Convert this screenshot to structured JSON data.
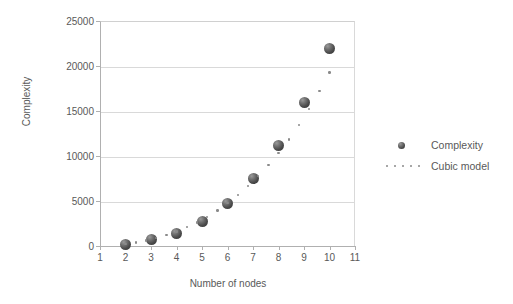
{
  "chart_data": {
    "type": "scatter",
    "title": "",
    "xlabel": "Number of nodes",
    "ylabel": "Complexity",
    "xlim": [
      1,
      11
    ],
    "ylim": [
      0,
      25000
    ],
    "xticks": [
      1,
      2,
      3,
      4,
      5,
      6,
      7,
      8,
      9,
      10,
      11
    ],
    "xtick_labels": [
      "1",
      "2",
      "3",
      "4",
      "5",
      "6",
      "7",
      "8",
      "9",
      "10",
      "11"
    ],
    "yticks": [
      0,
      5000,
      10000,
      15000,
      20000,
      25000
    ],
    "ytick_labels": [
      "0",
      "5000",
      "10000",
      "15000",
      "20000",
      "25000"
    ],
    "grid": "horizontal",
    "legend_position": "right",
    "series": [
      {
        "name": "Complexity",
        "type": "scatter",
        "marker": "sphere",
        "color": "#4a4a4a",
        "x": [
          2,
          3,
          4,
          5,
          6,
          7,
          8,
          9,
          10
        ],
        "values": [
          200,
          700,
          1400,
          2700,
          4700,
          7500,
          11200,
          16000,
          22000
        ]
      },
      {
        "name": "Cubic model",
        "type": "line",
        "style": "dotted",
        "color": "#8a8a8a",
        "x": [
          2,
          2.4,
          2.8,
          3.2,
          3.6,
          4,
          4.4,
          4.8,
          5.2,
          5.6,
          6,
          6.4,
          6.8,
          7.2,
          7.6,
          8,
          8.4,
          8.8,
          9.2,
          9.6,
          10
        ],
        "values": [
          200,
          380,
          600,
          880,
          1220,
          1620,
          2080,
          2620,
          3240,
          3950,
          4750,
          5650,
          6650,
          7760,
          8990,
          10350,
          11840,
          13470,
          15250,
          17190,
          19300
        ]
      }
    ]
  },
  "legend": {
    "items": [
      {
        "label": "Complexity",
        "key": "sphere-marker"
      },
      {
        "label": "Cubic model",
        "key": "dotted-line"
      }
    ]
  },
  "colors": {
    "marker": "#4a4a4a",
    "model_line": "#8a8a8a",
    "gridline": "#d9d9d9",
    "axis": "#b0b0b0",
    "text": "#595959",
    "background": "#ffffff"
  }
}
